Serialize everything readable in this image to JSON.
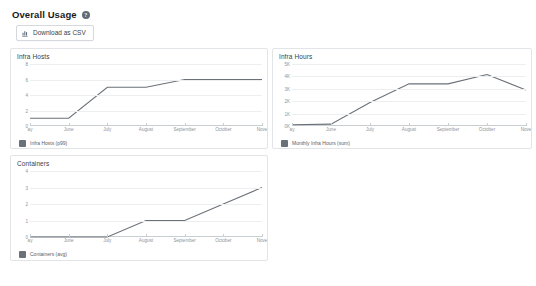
{
  "header": {
    "title": "Overall Usage",
    "help_icon": "question-mark-icon"
  },
  "toolbar": {
    "download_label": "Download as CSV",
    "download_icon": "bar-chart-download-icon"
  },
  "theme": {
    "line_color": "#6b7178",
    "grid_color": "#eceef0",
    "axis_color": "#c9ced3",
    "card_border": "#e2e5e8",
    "text_color": "#3a4149",
    "muted_text": "#8d949b",
    "background": "#ffffff"
  },
  "chart_data": [
    {
      "type": "line",
      "title": "Infra Hosts",
      "xlabel": "",
      "ylabel": "",
      "grid": true,
      "legend_position": "bottom-left",
      "categories": [
        "ay",
        "June",
        "July",
        "August",
        "September",
        "October",
        "Nove"
      ],
      "ytick_labels": [
        "8",
        "6",
        "4",
        "2",
        "0"
      ],
      "ytick_values": [
        8,
        6,
        4,
        2,
        0
      ],
      "ylim": [
        0,
        8
      ],
      "series": [
        {
          "name": "Infra Hosts (p99)",
          "values": [
            1,
            1,
            5,
            5,
            6,
            6,
            6
          ]
        }
      ]
    },
    {
      "type": "line",
      "title": "Infra Hours",
      "xlabel": "",
      "ylabel": "",
      "grid": true,
      "legend_position": "bottom-left",
      "categories": [
        "ay",
        "June",
        "July",
        "August",
        "September",
        "October",
        "Nove"
      ],
      "ytick_labels": [
        "5K",
        "4K",
        "3K",
        "2K",
        "1K",
        "0K"
      ],
      "ytick_values": [
        5000,
        4000,
        3000,
        2000,
        1000,
        0
      ],
      "ylim": [
        0,
        5000
      ],
      "series": [
        {
          "name": "Monthly Infra Hours (sum)",
          "values": [
            100,
            150,
            1900,
            3400,
            3400,
            4150,
            2900
          ]
        }
      ]
    },
    {
      "type": "line",
      "title": "Containers",
      "xlabel": "",
      "ylabel": "",
      "grid": true,
      "legend_position": "bottom-left",
      "categories": [
        "ay",
        "June",
        "July",
        "August",
        "September",
        "October",
        "Nove"
      ],
      "ytick_labels": [
        "4",
        "3",
        "2",
        "1",
        "0"
      ],
      "ytick_values": [
        4,
        3,
        2,
        1,
        0
      ],
      "ylim": [
        0,
        4
      ],
      "series": [
        {
          "name": "Containers (avg)",
          "values": [
            0,
            0,
            0,
            1,
            1,
            2,
            3
          ]
        }
      ]
    }
  ]
}
